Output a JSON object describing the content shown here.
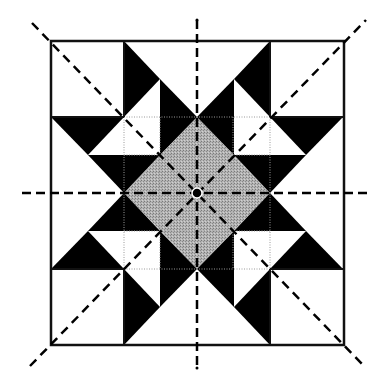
{
  "diagram": {
    "type": "quilt-block-symmetry",
    "grid": {
      "cols": 4,
      "rows": 4,
      "x": [
        51,
        124,
        197,
        270,
        344
      ],
      "y": [
        41,
        117,
        193,
        269,
        345
      ]
    },
    "center": [
      197,
      193
    ],
    "colors": {
      "background": "#ffffff",
      "dark": "#000000",
      "gray": "#a9a9a9",
      "line": "#111111",
      "grid_dotted": "#9a9a9a"
    },
    "symmetry_axes": [
      {
        "name": "vertical-axis",
        "x1": 197,
        "y1": 20,
        "x2": 197,
        "y2": 370
      },
      {
        "name": "horizontal-axis",
        "x1": 22,
        "y1": 193,
        "x2": 372,
        "y2": 193
      },
      {
        "name": "diagonal-axis-main",
        "x1": 32,
        "y1": 23,
        "x2": 364,
        "y2": 366
      },
      {
        "name": "diagonal-axis-anti",
        "x1": 30,
        "y1": 366,
        "x2": 366,
        "y2": 20
      }
    ],
    "center_diamond": {
      "points": "197,117 270,193 197,269 124,193"
    },
    "quadrant_top_left_black": [
      "124,41 160,79 124,117",
      "160,79 197,117 160,117",
      "51,117 124,117 88,155",
      "88,155 160,155 124,193",
      "160,117 197,117 160,155"
    ]
  }
}
